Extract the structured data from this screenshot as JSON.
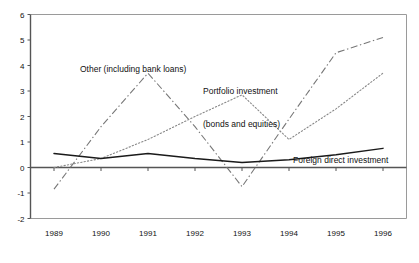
{
  "chart_data": {
    "type": "line",
    "title": "",
    "subtitle": "",
    "xlabel": "",
    "ylabel": "",
    "x": [
      "1989",
      "1990",
      "1991",
      "1992",
      "1993",
      "1994",
      "1995",
      "1996"
    ],
    "categories": [
      "1989",
      "1990",
      "1991",
      "1992",
      "1993",
      "1994",
      "1995",
      "1996"
    ],
    "xlim": [
      1988.6,
      1996.4
    ],
    "ylim": [
      -2,
      6
    ],
    "yticks": [
      -2,
      -1,
      0,
      1,
      2,
      3,
      4,
      5,
      6
    ],
    "ytick_labels": [
      "-2",
      "-1",
      "0",
      "1",
      "2",
      "3",
      "4",
      "5",
      "6"
    ],
    "xticks": [
      1989,
      1990,
      1991,
      1992,
      1993,
      1994,
      1995,
      1996
    ],
    "grid": false,
    "legend": "inline-annotations",
    "series": [
      {
        "name": "Foreign direct investment",
        "style": "solid",
        "color": "#1a1a1a",
        "values": [
          0.55,
          0.35,
          0.55,
          0.35,
          0.2,
          0.3,
          0.5,
          0.75
        ]
      },
      {
        "name": "Other (including bank loans)",
        "style": "dash-dot",
        "color": "#777777",
        "values": [
          -0.85,
          1.6,
          3.7,
          1.6,
          -0.75,
          1.9,
          4.5,
          5.1
        ]
      },
      {
        "name": "Portfolio investment (bonds and equities)",
        "style": "dotted",
        "color": "#888888",
        "values": [
          0.0,
          0.35,
          1.1,
          2.0,
          2.85,
          1.1,
          2.3,
          3.7
        ]
      }
    ],
    "annotations": [
      {
        "id": "other",
        "text": "Other (including bank loans)",
        "series": "Other (including bank loans)"
      },
      {
        "id": "portfolio",
        "line1": "Portfolio investment",
        "line2": "(bonds and equities)",
        "series": "Portfolio investment (bonds and equities)"
      },
      {
        "id": "fdi",
        "text": "Foreign direct investment",
        "series": "Foreign direct investment"
      }
    ]
  },
  "axes": {
    "y_tick_labels": [
      "6",
      "5",
      "4",
      "3",
      "2",
      "1",
      "0",
      "-1",
      "-2"
    ],
    "x_tick_labels": [
      "1989",
      "1990",
      "1991",
      "1992",
      "1993",
      "1994",
      "1995",
      "1996"
    ]
  },
  "colors": {
    "axis": "#555555",
    "frame": "#9a9a9a",
    "solid_series": "#1a1a1a",
    "dashdot_series": "#777777",
    "dotted_series": "#888888",
    "background": "#ffffff",
    "text": "#111111"
  }
}
